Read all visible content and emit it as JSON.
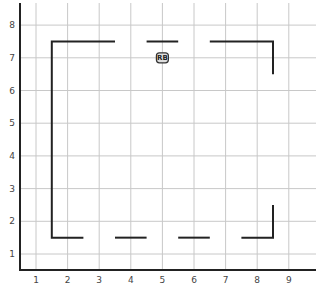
{
  "chart_data": {
    "type": "line",
    "title": "",
    "xlabel": "",
    "ylabel": "",
    "xlim": [
      0.5,
      9.9
    ],
    "ylim": [
      0.5,
      8.5
    ],
    "xticks": [
      1,
      2,
      3,
      4,
      5,
      6,
      7,
      8,
      9
    ],
    "yticks": [
      1,
      2,
      3,
      4,
      5,
      6,
      7,
      8
    ],
    "grid": true,
    "walls": [
      {
        "points": [
          [
            3.5,
            7.5
          ],
          [
            1.5,
            7.5
          ],
          [
            1.5,
            1.5
          ],
          [
            2.5,
            1.5
          ]
        ]
      },
      {
        "points": [
          [
            4.5,
            7.5
          ],
          [
            5.5,
            7.5
          ]
        ]
      },
      {
        "points": [
          [
            6.5,
            7.5
          ],
          [
            8.5,
            7.5
          ],
          [
            8.5,
            6.5
          ]
        ]
      },
      {
        "points": [
          [
            3.5,
            1.5
          ],
          [
            4.5,
            1.5
          ]
        ]
      },
      {
        "points": [
          [
            5.5,
            1.5
          ],
          [
            6.5,
            1.5
          ]
        ]
      },
      {
        "points": [
          [
            7.5,
            1.5
          ],
          [
            8.5,
            1.5
          ],
          [
            8.5,
            2.5
          ]
        ]
      }
    ],
    "markers": [
      {
        "label": "RB",
        "x": 5,
        "y": 7
      }
    ]
  }
}
